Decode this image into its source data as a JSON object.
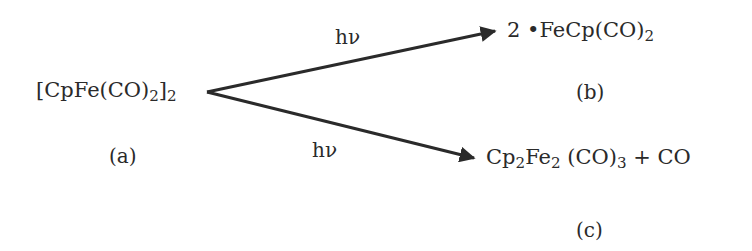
{
  "diagram": {
    "type": "chemical-reaction-scheme",
    "reactant": {
      "formula_parts": [
        "[CpFe(CO)",
        "2",
        "]",
        "2"
      ],
      "label": "(a)"
    },
    "arrows": [
      {
        "condition": "hν",
        "from": [
          207,
          92
        ],
        "to": [
          497,
          31
        ],
        "target": "product_b"
      },
      {
        "condition": "hν",
        "from": [
          207,
          92
        ],
        "to": [
          476,
          158
        ],
        "target": "product_c"
      }
    ],
    "product_b": {
      "formula_parts": [
        "2 ",
        "•",
        "FeCp(CO)",
        "2"
      ],
      "label": "(b)"
    },
    "product_c": {
      "formula_parts": [
        "Cp",
        "2",
        "Fe",
        "2",
        " (CO)",
        "3",
        " + CO"
      ],
      "label": "(c)"
    },
    "colors": {
      "ink": "#2a2a2a",
      "background": "#ffffff"
    }
  }
}
